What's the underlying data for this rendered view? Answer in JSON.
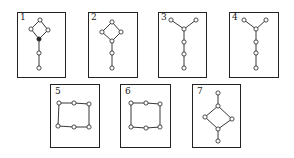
{
  "figure": {
    "colors": {
      "stroke": "#222222",
      "background": "#ffffff",
      "node_fill": "#ffffff",
      "filled_node": "#222222"
    },
    "panels": [
      {
        "label": "1",
        "box": [
          17,
          12,
          48,
          65
        ],
        "label_pos": [
          20,
          20
        ],
        "nodes": [
          [
            40,
            20
          ],
          [
            31,
            29
          ],
          [
            48,
            30
          ],
          [
            39,
            39
          ],
          [
            39,
            53
          ],
          [
            39,
            68
          ]
        ],
        "filled": [
          3
        ],
        "edges": [
          [
            0,
            1
          ],
          [
            0,
            2
          ],
          [
            1,
            3
          ],
          [
            2,
            3
          ],
          [
            3,
            4
          ],
          [
            4,
            5
          ]
        ]
      },
      {
        "label": "2",
        "box": [
          88,
          12,
          49,
          65
        ],
        "label_pos": [
          91,
          20
        ],
        "nodes": [
          [
            112,
            22
          ],
          [
            102,
            32
          ],
          [
            121,
            32
          ],
          [
            112,
            41
          ],
          [
            112,
            53
          ],
          [
            112,
            68
          ]
        ],
        "filled": [],
        "edges": [
          [
            0,
            1
          ],
          [
            0,
            2
          ],
          [
            1,
            3
          ],
          [
            2,
            3
          ],
          [
            3,
            4
          ],
          [
            4,
            5
          ]
        ]
      },
      {
        "label": "3",
        "box": [
          158,
          12,
          48,
          65
        ],
        "label_pos": [
          161,
          20
        ],
        "nodes": [
          [
            171,
            20
          ],
          [
            196,
            20
          ],
          [
            184,
            29
          ],
          [
            184,
            42
          ],
          [
            184,
            54
          ],
          [
            184,
            68
          ]
        ],
        "filled": [],
        "edges": [
          [
            0,
            2
          ],
          [
            1,
            2
          ],
          [
            2,
            3
          ],
          [
            3,
            4
          ],
          [
            4,
            5
          ]
        ]
      },
      {
        "label": "4",
        "box": [
          229,
          12,
          49,
          65
        ],
        "label_pos": [
          232,
          20
        ],
        "nodes": [
          [
            244,
            20
          ],
          [
            266,
            20
          ],
          [
            256,
            29
          ],
          [
            256,
            42
          ],
          [
            256,
            53
          ],
          [
            256,
            68
          ]
        ],
        "filled": [],
        "edges": [
          [
            0,
            2
          ],
          [
            1,
            2
          ],
          [
            2,
            3
          ],
          [
            3,
            4
          ],
          [
            4,
            5
          ]
        ]
      },
      {
        "label": "5",
        "box": [
          50,
          84,
          49,
          63
        ],
        "label_pos": [
          55,
          94
        ],
        "nodes": [
          [
            59,
            103
          ],
          [
            74,
            103
          ],
          [
            89,
            104
          ],
          [
            58,
            126
          ],
          [
            74,
            127
          ],
          [
            89,
            127
          ]
        ],
        "filled": [],
        "edges": [
          [
            0,
            1
          ],
          [
            1,
            2
          ],
          [
            2,
            5
          ],
          [
            5,
            4
          ],
          [
            4,
            3
          ],
          [
            3,
            0
          ]
        ]
      },
      {
        "label": "6",
        "box": [
          120,
          84,
          50,
          63
        ],
        "label_pos": [
          125,
          94
        ],
        "nodes": [
          [
            131,
            103
          ],
          [
            146,
            103
          ],
          [
            160,
            104
          ],
          [
            131,
            127
          ],
          [
            146,
            128
          ],
          [
            160,
            127
          ]
        ],
        "filled": [],
        "edges": [
          [
            0,
            1
          ],
          [
            1,
            2
          ],
          [
            2,
            5
          ],
          [
            5,
            4
          ],
          [
            4,
            3
          ],
          [
            3,
            0
          ]
        ]
      },
      {
        "label": "7",
        "box": [
          192,
          84,
          48,
          63
        ],
        "label_pos": [
          197,
          94
        ],
        "nodes": [
          [
            218,
            93
          ],
          [
            218,
            106
          ],
          [
            205,
            117
          ],
          [
            232,
            119
          ],
          [
            218,
            129
          ],
          [
            218,
            141
          ]
        ],
        "filled": [],
        "edges": [
          [
            0,
            1
          ],
          [
            1,
            2
          ],
          [
            1,
            3
          ],
          [
            2,
            4
          ],
          [
            3,
            4
          ],
          [
            4,
            5
          ]
        ]
      }
    ]
  }
}
